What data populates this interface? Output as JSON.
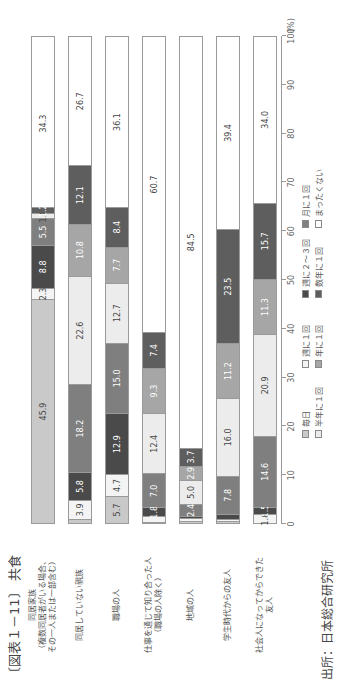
{
  "header": {
    "title": "〔図表１－11〕 共食",
    "source": "出所：日本総合研究所"
  },
  "legend": [
    {
      "label": "毎日",
      "color": "#c9c9c9",
      "text_color": "#444"
    },
    {
      "label": "週に１回",
      "color": "#f4f4f4",
      "text_color": "#444"
    },
    {
      "label": "週に２～３回",
      "color": "#4a4a4a",
      "text_color": "#fff"
    },
    {
      "label": "月に１回",
      "color": "#7f7f7f",
      "text_color": "#fff"
    },
    {
      "label": "半年に１回",
      "color": "#ececec",
      "text_color": "#444"
    },
    {
      "label": "年に１回",
      "color": "#a6a6a6",
      "text_color": "#fff"
    },
    {
      "label": "数年に１回",
      "color": "#5e5e5e",
      "text_color": "#fff"
    },
    {
      "label": "まったくない",
      "color": "#ffffff",
      "text_color": "#444"
    }
  ],
  "axis": {
    "ticks": [
      "0",
      "10",
      "20",
      "30",
      "40",
      "50",
      "60",
      "70",
      "80",
      "90",
      "100"
    ],
    "unit": "(%)"
  },
  "chart_data": {
    "type": "bar",
    "orientation": "horizontal-stacked (image rotated 90°)",
    "title": "〔図表１－11〕 共食",
    "xlabel": "",
    "ylabel": "",
    "xlim": [
      0,
      100
    ],
    "unit": "%",
    "categories": [
      "同居家族（複数同居者がいる場合、その一人または一部含む）",
      "同居していない親族",
      "職場の人",
      "仕事を通じて知り合った人（職場の人除く）",
      "地域の人",
      "学生時代からの友人",
      "社会人になってからできた友人"
    ],
    "series": [
      {
        "name": "毎日",
        "values": [
          45.9,
          0.9,
          5.7,
          0.3,
          0.4,
          0.4,
          0.0
        ]
      },
      {
        "name": "週に１回",
        "values": [
          2.3,
          3.9,
          4.7,
          1.1,
          0.6,
          0.5,
          1.8
        ]
      },
      {
        "name": "週に２～３回",
        "values": [
          8.8,
          5.8,
          12.9,
          1.8,
          0.5,
          1.0,
          1.5
        ]
      },
      {
        "name": "月に１回",
        "values": [
          5.5,
          18.2,
          15.0,
          7.0,
          2.4,
          7.8,
          14.6
        ]
      },
      {
        "name": "半年に１回",
        "values": [
          1.0,
          22.6,
          12.7,
          12.4,
          5.0,
          16.0,
          20.9
        ]
      },
      {
        "name": "年に１回",
        "values": [
          0.0,
          10.8,
          7.7,
          9.3,
          2.9,
          11.2,
          11.3
        ]
      },
      {
        "name": "数年に１回",
        "values": [
          1.2,
          12.1,
          8.4,
          7.4,
          3.7,
          23.5,
          15.7
        ]
      },
      {
        "name": "まったくない",
        "values": [
          34.3,
          26.7,
          36.1,
          60.7,
          84.5,
          39.4,
          34.0
        ]
      }
    ],
    "legend_position": "bottom",
    "grid": false
  },
  "rows": [
    {
      "label": "同居家族\n（複数同居者がいる場合、\nその一人または一部含む）",
      "values": [
        45.9,
        2.3,
        8.8,
        5.5,
        1.0,
        0.0,
        1.2,
        34.3
      ],
      "shown": [
        "45.9",
        "2.3",
        "8.8",
        "5.5",
        "1.0",
        "",
        "1.2",
        "34.3"
      ]
    },
    {
      "label": "同居していない親族",
      "values": [
        0.9,
        3.9,
        5.8,
        18.2,
        22.6,
        10.8,
        12.1,
        26.7
      ],
      "shown": [
        "",
        "3.9",
        "5.8",
        "18.2",
        "22.6",
        "10.8",
        "12.1",
        "26.7"
      ]
    },
    {
      "label": "職場の人",
      "values": [
        5.7,
        4.7,
        12.9,
        15.0,
        12.7,
        7.7,
        8.4,
        36.1
      ],
      "shown": [
        "5.7",
        "4.7",
        "12.9",
        "15.0",
        "12.7",
        "7.7",
        "8.4",
        "36.1"
      ]
    },
    {
      "label": "仕事を通じて知り合った人\n（職場の人除く）",
      "values": [
        0.3,
        1.1,
        1.8,
        7.0,
        12.4,
        9.3,
        7.4,
        60.7
      ],
      "shown": [
        "",
        "",
        "1.8",
        "7.0",
        "12.4",
        "9.3",
        "7.4",
        "60.7"
      ]
    },
    {
      "label": "地域の人",
      "values": [
        0.4,
        0.6,
        0.5,
        2.4,
        5.0,
        2.9,
        3.7,
        84.5
      ],
      "shown": [
        "",
        "",
        "",
        "2.4",
        "5.0",
        "2.9",
        "3.7",
        "84.5"
      ]
    },
    {
      "label": "学生時代からの友人",
      "values": [
        0.4,
        0.5,
        1.0,
        7.8,
        16.0,
        11.2,
        23.5,
        39.4
      ],
      "shown": [
        "",
        "",
        "",
        "7.8",
        "16.0",
        "11.2",
        "23.5",
        "39.4"
      ]
    },
    {
      "label": "社会人になってからできた\n友人",
      "values": [
        0.0,
        1.8,
        1.5,
        14.6,
        20.9,
        11.3,
        15.7,
        34.0
      ],
      "shown": [
        "",
        "1.8",
        "1.5",
        "14.6",
        "20.9",
        "11.3",
        "15.7",
        "34.0"
      ]
    }
  ]
}
